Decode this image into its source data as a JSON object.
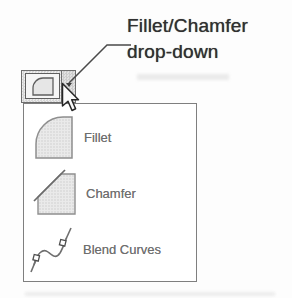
{
  "figure": {
    "annotation": {
      "line1": "Fillet/Chamfer",
      "line2": "drop-down"
    },
    "toolbar_button": {
      "tool_icon": "fillet-icon",
      "dropdown_icon": "dropdown-arrow-icon"
    },
    "menu": {
      "items": [
        {
          "id": "fillet",
          "label": "Fillet",
          "icon": "fillet-icon"
        },
        {
          "id": "chamfer",
          "label": "Chamfer",
          "icon": "chamfer-icon"
        },
        {
          "id": "blend-curves",
          "label": "Blend Curves",
          "icon": "blend-curves-icon"
        }
      ]
    },
    "cursor": "arrow-cursor-icon",
    "colors": {
      "annotation_text": "#303030",
      "menu_label_text": "#6e6e6e",
      "menu_border": "#7f7f7f",
      "icon_fill": "#e8e8e8",
      "icon_stroke": "#8f8f8f",
      "button_hatch": "#d6d6d6"
    }
  }
}
